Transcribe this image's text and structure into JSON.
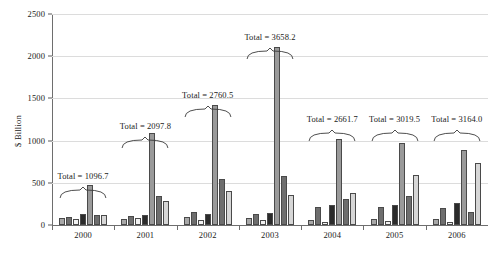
{
  "chart_data": {
    "type": "bar",
    "title": "",
    "xlabel": "",
    "ylabel": "$ Billion",
    "ylim": [
      0,
      2500
    ],
    "yticks": [
      0,
      500,
      1000,
      1500,
      2000,
      2500
    ],
    "ytick_labels": [
      "0",
      "500",
      "1000",
      "1500",
      "2000",
      "2500"
    ],
    "grid": true,
    "legend": "none",
    "categories": [
      "2000",
      "2001",
      "2002",
      "2003",
      "2004",
      "2005",
      "2006"
    ],
    "series": [
      {
        "name": "series-1",
        "color": "#a8a8a8",
        "values": [
          78,
          74,
          95,
          88,
          60,
          72,
          68
        ]
      },
      {
        "name": "series-2",
        "color": "#6e6e6e",
        "values": [
          92,
          108,
          150,
          126,
          210,
          218,
          205
        ]
      },
      {
        "name": "series-3",
        "color": "#f2f2f2",
        "values": [
          70,
          88,
          62,
          55,
          35,
          42,
          40
        ]
      },
      {
        "name": "series-4",
        "color": "#2b2b2b",
        "values": [
          135,
          124,
          128,
          142,
          232,
          238,
          260
        ]
      },
      {
        "name": "series-5",
        "color": "#9a9a9a",
        "values": [
          478,
          1085,
          1425,
          2110,
          1015,
          970,
          890
        ]
      },
      {
        "name": "series-6",
        "color": "#6e6e6e",
        "values": [
          122,
          345,
          540,
          580,
          305,
          345,
          160
        ]
      },
      {
        "name": "series-7",
        "color": "#d6d6d6",
        "values": [
          122,
          290,
          398,
          352,
          380,
          588,
          735
        ]
      }
    ],
    "annotations": [
      {
        "category": "2000",
        "text": "Total = 1096.7",
        "value": 1096.7
      },
      {
        "category": "2001",
        "text": "Total = 2097.8",
        "value": 2097.8
      },
      {
        "category": "2002",
        "text": "Total = 2760.5",
        "value": 2760.5
      },
      {
        "category": "2003",
        "text": "Total = 3658.2",
        "value": 3658.2
      },
      {
        "category": "2004",
        "text": "Total = 2661.7",
        "value": 2661.7
      },
      {
        "category": "2005",
        "text": "Total = 3019.5",
        "value": 3019.5
      },
      {
        "category": "2006",
        "text": "Total = 3164.0",
        "value": 3164.0
      }
    ],
    "annotation_tops": [
      640,
      1230,
      1600,
      2290,
      1320,
      1320,
      1320
    ]
  }
}
